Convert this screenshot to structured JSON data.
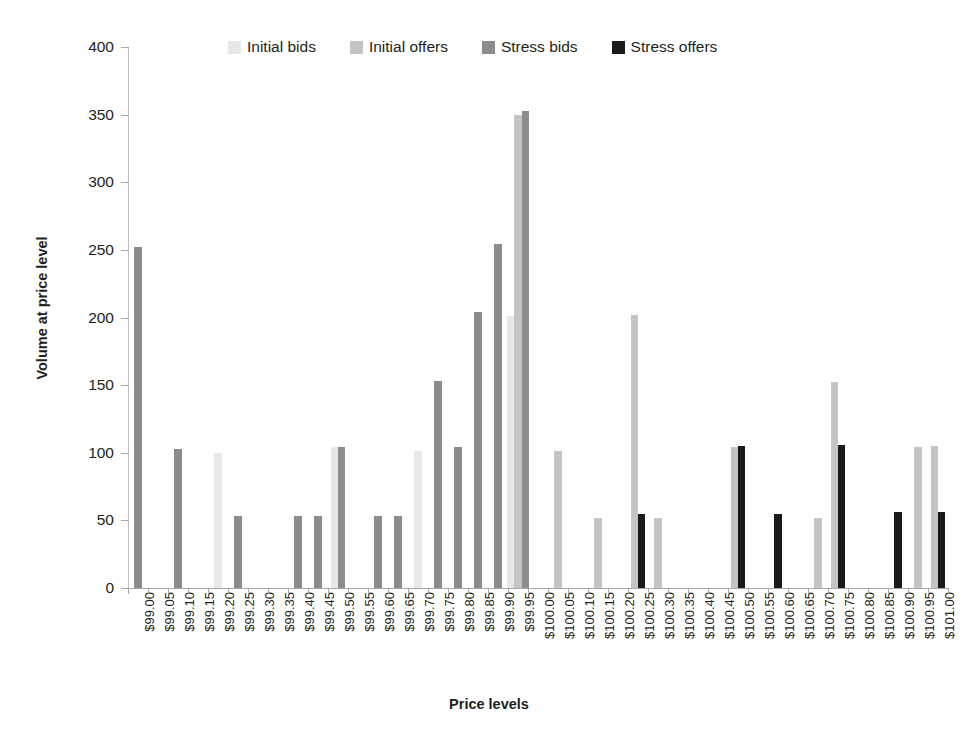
{
  "chart_data": {
    "type": "bar",
    "title": "",
    "xlabel": "Price levels",
    "ylabel": "Volume at price level",
    "ylim": [
      0,
      400
    ],
    "yticks": [
      0,
      50,
      100,
      150,
      200,
      250,
      300,
      350,
      400
    ],
    "grid": false,
    "legend_position": "top",
    "categories": [
      "$99.00",
      "$99.05",
      "$99.10",
      "$99.15",
      "$99.20",
      "$99.25",
      "$99.30",
      "$99.35",
      "$99.40",
      "$99.45",
      "$99.50",
      "$99.55",
      "$99.60",
      "$99.65",
      "$99.70",
      "$99.75",
      "$99.80",
      "$99.85",
      "$99.90",
      "$99.95",
      "$100.00",
      "$100.05",
      "$100.10",
      "$100.15",
      "$100.20",
      "$100.25",
      "$100.30",
      "$100.35",
      "$100.40",
      "$100.45",
      "$100.50",
      "$100.55",
      "$100.60",
      "$100.65",
      "$100.70",
      "$100.75",
      "$100.80",
      "$100.85",
      "$100.90",
      "$100.95",
      "$101.00"
    ],
    "series": [
      {
        "name": "Initial bids",
        "color": "#e8e8e8",
        "values": [
          0,
          0,
          0,
          0,
          100,
          0,
          0,
          0,
          0,
          0,
          104,
          0,
          0,
          0,
          101,
          0,
          0,
          0,
          0,
          201,
          0,
          0,
          0,
          0,
          0,
          0,
          0,
          0,
          0,
          0,
          0,
          0,
          0,
          0,
          0,
          0,
          0,
          0,
          0,
          0,
          0
        ]
      },
      {
        "name": "Initial offers",
        "color": "#c4c4c4",
        "values": [
          0,
          0,
          0,
          0,
          0,
          0,
          0,
          0,
          0,
          0,
          0,
          0,
          0,
          0,
          0,
          0,
          0,
          0,
          0,
          350,
          0,
          101,
          0,
          52,
          0,
          202,
          52,
          0,
          0,
          0,
          104,
          0,
          0,
          0,
          52,
          152,
          0,
          0,
          0,
          104,
          105
        ]
      },
      {
        "name": "Stress bids",
        "color": "#8c8c8c",
        "values": [
          252,
          0,
          103,
          0,
          0,
          53,
          0,
          0,
          53,
          53,
          104,
          0,
          53,
          53,
          0,
          153,
          104,
          204,
          254,
          353,
          0,
          0,
          0,
          0,
          0,
          0,
          0,
          0,
          0,
          0,
          0,
          0,
          0,
          0,
          0,
          0,
          0,
          0,
          0,
          0,
          0
        ]
      },
      {
        "name": "Stress offers",
        "color": "#1a1a1a",
        "values": [
          0,
          0,
          0,
          0,
          0,
          0,
          0,
          0,
          0,
          0,
          0,
          0,
          0,
          0,
          0,
          0,
          0,
          0,
          0,
          0,
          0,
          0,
          0,
          0,
          0,
          55,
          0,
          0,
          0,
          0,
          105,
          0,
          55,
          0,
          0,
          106,
          0,
          0,
          56,
          0,
          56
        ]
      }
    ]
  },
  "legend": {
    "items": [
      {
        "label": "Initial bids",
        "color": "#e8e8e8"
      },
      {
        "label": "Initial offers",
        "color": "#c4c4c4"
      },
      {
        "label": "Stress bids",
        "color": "#8c8c8c"
      },
      {
        "label": "Stress offers",
        "color": "#1a1a1a"
      }
    ]
  }
}
